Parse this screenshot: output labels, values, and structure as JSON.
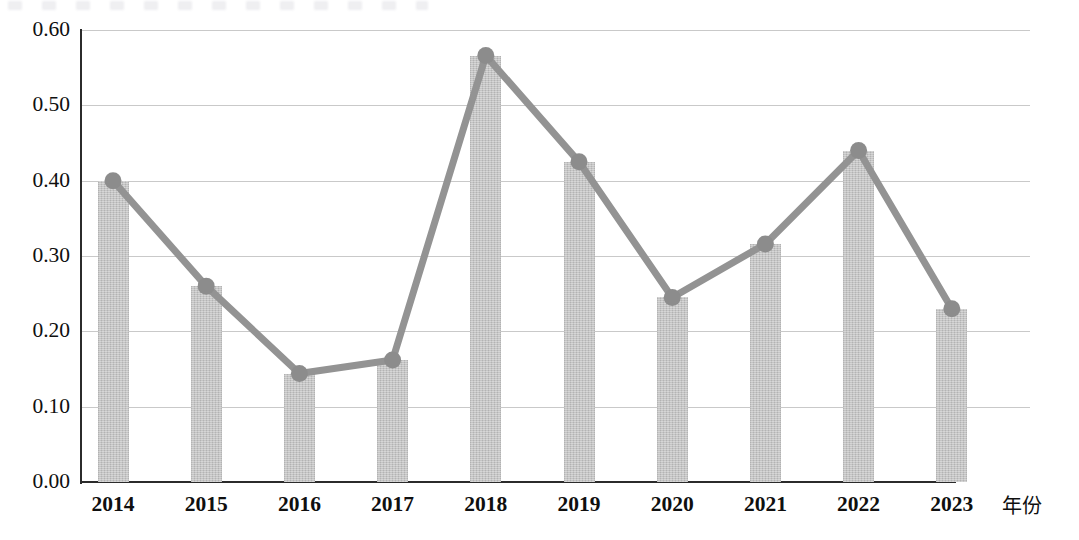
{
  "chart_data": {
    "type": "bar",
    "title": "",
    "subtitle": "",
    "xlabel": "年份",
    "ylabel": "",
    "categories": [
      "2014",
      "2015",
      "2016",
      "2017",
      "2018",
      "2019",
      "2020",
      "2021",
      "2022",
      "2023"
    ],
    "values": [
      0.4,
      0.26,
      0.144,
      0.162,
      0.566,
      0.425,
      0.245,
      0.316,
      0.44,
      0.23
    ],
    "series": [
      {
        "name": "bar-series",
        "type": "bar",
        "values": [
          0.4,
          0.26,
          0.144,
          0.162,
          0.566,
          0.425,
          0.245,
          0.316,
          0.44,
          0.23
        ]
      },
      {
        "name": "line-series",
        "type": "line",
        "values": [
          0.4,
          0.26,
          0.144,
          0.162,
          0.566,
          0.425,
          0.245,
          0.316,
          0.44,
          0.23
        ]
      }
    ],
    "ylim": [
      0.0,
      0.6
    ],
    "ytick_labels": [
      "0.60",
      "0.50",
      "0.40",
      "0.30",
      "0.20",
      "0.10",
      "0.00"
    ],
    "ytick_values": [
      0.6,
      0.5,
      0.4,
      0.3,
      0.2,
      0.1,
      0.0
    ],
    "grid": true,
    "legend": "none",
    "colors": {
      "bar_fill": "#bfbfbf",
      "line": "#939393",
      "marker": "#8c8c8c",
      "gridline": "#c9c9c9",
      "axis": "#2b2b2b",
      "text": "#0f0f0f"
    }
  },
  "axis": {
    "y_ticks": [
      {
        "label": "0.60",
        "value": 0.6
      },
      {
        "label": "0.50",
        "value": 0.5
      },
      {
        "label": "0.40",
        "value": 0.4
      },
      {
        "label": "0.30",
        "value": 0.3
      },
      {
        "label": "0.20",
        "value": 0.2
      },
      {
        "label": "0.10",
        "value": 0.1
      },
      {
        "label": "0.00",
        "value": 0.0
      }
    ],
    "x_ticks": [
      {
        "label": "2014"
      },
      {
        "label": "2015"
      },
      {
        "label": "2016"
      },
      {
        "label": "2017"
      },
      {
        "label": "2018"
      },
      {
        "label": "2019"
      },
      {
        "label": "2020"
      },
      {
        "label": "2021"
      },
      {
        "label": "2022"
      },
      {
        "label": "2023"
      }
    ],
    "x_title": "年份"
  }
}
